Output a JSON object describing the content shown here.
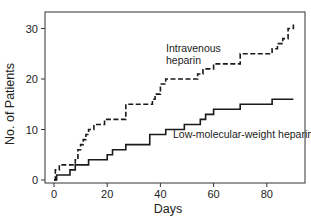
{
  "chart_data": {
    "type": "line",
    "subtype": "step",
    "title": "",
    "xlabel": "Days",
    "ylabel": "No. of Patients",
    "xlim": [
      0,
      95
    ],
    "ylim": [
      0,
      33
    ],
    "x_ticks": [
      0,
      20,
      40,
      60,
      80
    ],
    "y_ticks": [
      0,
      10,
      20,
      30
    ],
    "grid": false,
    "legend": "inline annotations",
    "series": [
      {
        "name": "Intravenous heparin",
        "style": "dashed",
        "x": [
          0,
          0.5,
          2,
          8,
          9,
          10,
          11,
          12,
          13,
          15,
          19,
          27,
          37,
          38,
          40,
          42,
          54,
          56,
          60,
          70,
          82,
          84,
          86,
          88,
          90
        ],
        "y": [
          0,
          2,
          3,
          4,
          6,
          7,
          8,
          9,
          10,
          11,
          12,
          15,
          16,
          17,
          19,
          20,
          21,
          22,
          23,
          25,
          26,
          27,
          28,
          30,
          31
        ]
      },
      {
        "name": "Low-molecular-weight heparin",
        "style": "solid",
        "x": [
          0,
          1,
          6,
          8,
          13,
          20,
          22,
          27,
          36,
          42,
          49,
          55,
          57,
          60,
          70,
          82,
          90
        ],
        "y": [
          0,
          1,
          2,
          3,
          4,
          5,
          6,
          7,
          9,
          10,
          11,
          12,
          13,
          14,
          15,
          16,
          16
        ]
      }
    ],
    "annotations": [
      {
        "text_lines": [
          "Intravenous",
          "heparin"
        ],
        "x": 45,
        "y": 24.5
      },
      {
        "text_lines": [
          "Low-molecular-weight heparin"
        ],
        "x": 41,
        "y": 8
      }
    ]
  },
  "labels": {
    "xlabel": "Days",
    "ylabel": "No. of Patients",
    "iv_line1": "Intravenous",
    "iv_line2": "heparin",
    "lmwh": "Low-molecular-weight heparin"
  }
}
